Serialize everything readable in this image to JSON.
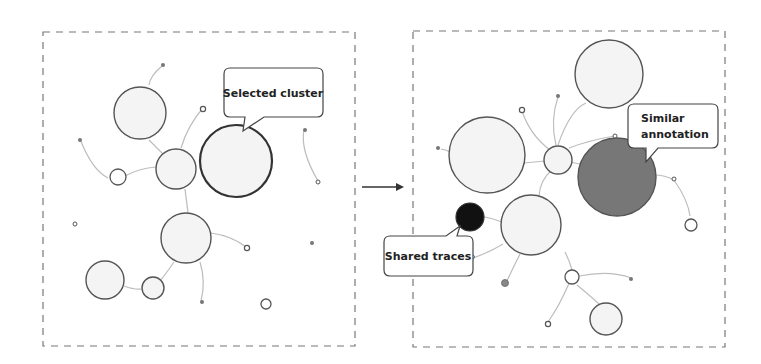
{
  "colors": {
    "frame": "#777777",
    "node_stroke": "#555555",
    "node_fill": "#f4f4f4",
    "edge": "#bdbdbd",
    "selected_stroke": "#333333",
    "similar_fill": "#777777",
    "shared_fill": "#111111",
    "dot_fill": "#777777",
    "arrow": "#333333"
  },
  "left_panel": {
    "callout": {
      "label": "Selected cluster"
    },
    "frame": {
      "x": 43,
      "y": 32,
      "w": 312,
      "h": 314
    }
  },
  "right_panel": {
    "callouts": [
      {
        "id": "similar",
        "lines": [
          "Similar",
          "annotation"
        ]
      },
      {
        "id": "shared",
        "lines": [
          "Shared traces"
        ]
      }
    ],
    "frame": {
      "x": 413,
      "y": 31,
      "w": 312,
      "h": 316
    }
  },
  "arrow": {
    "label": ""
  }
}
